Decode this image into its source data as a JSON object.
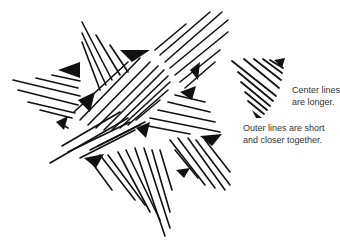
{
  "figure": {
    "stroke_color": "#111111",
    "background": "#ffffff"
  },
  "annotations": {
    "center_lines": [
      "Center lines",
      "are longer."
    ],
    "outer_lines": [
      "Outer lines are short",
      "and closer together."
    ]
  }
}
